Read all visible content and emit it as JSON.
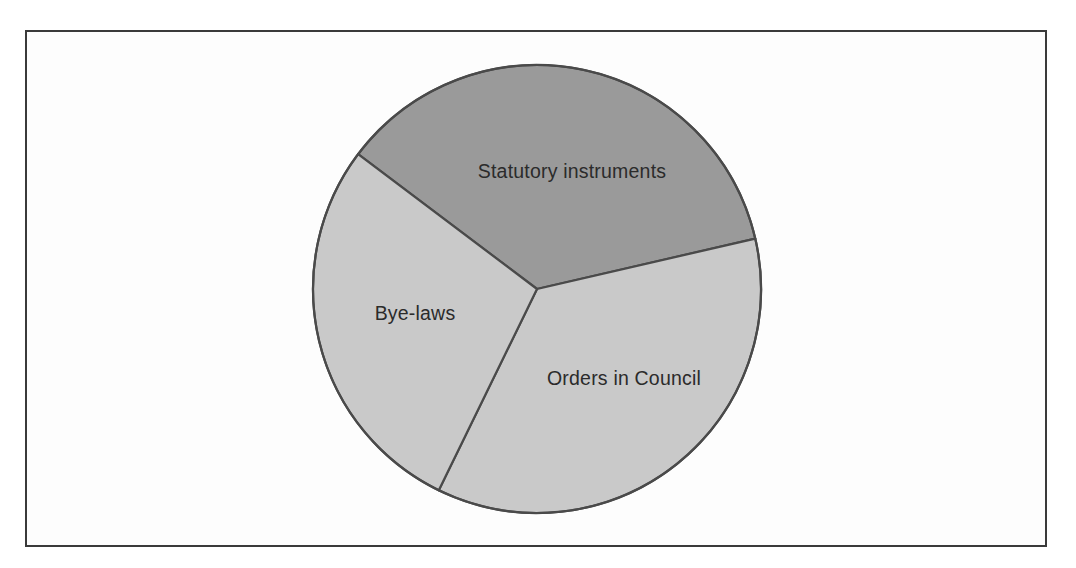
{
  "figure": {
    "frame_border_color": "#3a3a3a",
    "background_color": "#fdfdfd",
    "page_background_color": "#ffffff"
  },
  "chart_data": {
    "type": "pie",
    "title": "",
    "subtitle": "",
    "xlabel": "",
    "ylabel": "",
    "legend_position": "none",
    "grid": false,
    "labels_placement": "inside-slices",
    "start_angle_deg_clockwise_from_top": 307,
    "categories": [
      "Statutory instruments",
      "Orders in Council",
      "Bye-laws"
    ],
    "values": [
      36.1,
      35.8,
      28.1
    ],
    "slices": [
      {
        "label": "Statutory instruments",
        "value": 36.1,
        "angle_deg": 130,
        "start_deg": 307,
        "end_deg": 77,
        "color": "#9a9a9a",
        "label_x": 570,
        "label_y": 170
      },
      {
        "label": "Orders in Council",
        "value": 35.8,
        "angle_deg": 129,
        "start_deg": 77,
        "end_deg": 206,
        "color": "#c9c9c9",
        "label_x": 622,
        "label_y": 377
      },
      {
        "label": "Bye-laws",
        "value": 28.1,
        "angle_deg": 101,
        "start_deg": 206,
        "end_deg": 307,
        "color": "#c9c9c9",
        "label_x": 413,
        "label_y": 312
      }
    ],
    "slice_outline_color": "#4a4a4a",
    "center": {
      "x": 535,
      "y": 287
    },
    "radius": 224
  }
}
